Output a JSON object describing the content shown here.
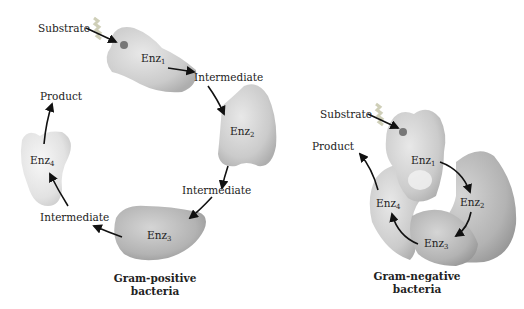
{
  "colors": {
    "enzyme_light": "#e6e6e6",
    "enzyme_mid": "#c9c9c9",
    "enzyme_dark": "#a8a8a8",
    "arrow": "#111111",
    "text": "#222222"
  },
  "gram_positive": {
    "caption_line1": "Gram-positive",
    "caption_line2": "bacteria",
    "substrate_label": "Substrate",
    "product_label": "Product",
    "intermediate_labels": [
      "Intermediate",
      "Intermediate",
      "Intermediate"
    ],
    "enzymes": [
      {
        "base": "Enz",
        "sub": "1"
      },
      {
        "base": "Enz",
        "sub": "2"
      },
      {
        "base": "Enz",
        "sub": "3"
      },
      {
        "base": "Enz",
        "sub": "4"
      }
    ]
  },
  "gram_negative": {
    "caption_line1": "Gram-negative",
    "caption_line2": "bacteria",
    "substrate_label": "Substrate",
    "product_label": "Product",
    "enzymes": [
      {
        "base": "Enz",
        "sub": "1"
      },
      {
        "base": "Enz",
        "sub": "2"
      },
      {
        "base": "Enz",
        "sub": "3"
      },
      {
        "base": "Enz",
        "sub": "4"
      }
    ]
  }
}
